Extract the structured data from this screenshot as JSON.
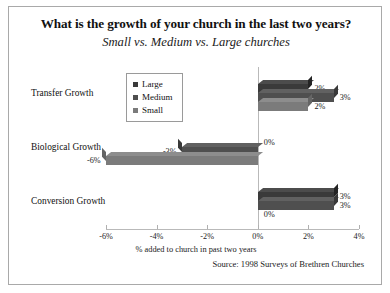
{
  "chart_data": {
    "type": "bar",
    "orientation": "horizontal",
    "title": "What is the growth of your church in the last two years?",
    "subtitle": "Small vs. Medium vs. Large churches",
    "xlabel": "% added to church in past two years",
    "ylabel": "",
    "categories": [
      "Transfer Growth",
      "Biological Growth",
      "Conversion Growth"
    ],
    "series": [
      {
        "name": "Large",
        "values": [
          2,
          0,
          3
        ],
        "labels": [
          "2%",
          "0%",
          "3%"
        ],
        "color": "#3a3a3a"
      },
      {
        "name": "Medium",
        "values": [
          3,
          -3,
          3
        ],
        "labels": [
          "3%",
          "-3%",
          "3%"
        ],
        "color": "#4f4f4f"
      },
      {
        "name": "Small",
        "values": [
          2,
          -6,
          0
        ],
        "labels": [
          "2%",
          "-6%",
          "0%"
        ],
        "color": "#7b7b7b"
      }
    ],
    "xticks": [
      -6,
      -4,
      -2,
      0,
      2,
      4
    ],
    "xtick_labels": [
      "-6%",
      "-4%",
      "-2%",
      "0%",
      "2%",
      "4%"
    ],
    "xlim": [
      -6,
      4
    ],
    "grid": false,
    "legend_position": "upper-left-inside",
    "legend_entries": [
      "Large",
      "Medium",
      "Small"
    ],
    "source": "Source: 1998 Surveys of Brethren Churches"
  },
  "icons": {
    "legend_marker": "square-marker-icon"
  },
  "colors": {
    "frame_border": "#a9a9a9",
    "axis": "#b9b9b9",
    "text": "#111111",
    "background": "#ffffff"
  }
}
